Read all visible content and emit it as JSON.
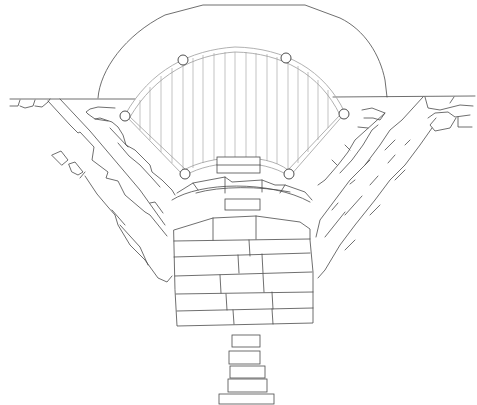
{
  "drawing": {
    "type": "architectural-plan",
    "subject": "stone structure plan with hatched central apse",
    "colors": {
      "line": "#4a4a4a",
      "hatch": "#9a9a9a",
      "background": "#ffffff"
    },
    "column_markers": 6,
    "steps_count": 5,
    "masonry_block_courses": 6
  }
}
